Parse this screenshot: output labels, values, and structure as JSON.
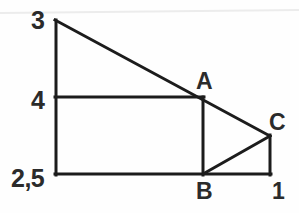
{
  "figure": {
    "type": "geometry-diagram",
    "width": 299,
    "height": 213,
    "background_color": "#fefefe",
    "stroke_color": "#1c1c1c",
    "stroke_width": 3,
    "labels": {
      "top_left": "3",
      "mid_left": "4",
      "bottom_left": "2,5",
      "point_a": "A",
      "point_b": "B",
      "point_c": "C",
      "bottom_right": "1"
    },
    "points": {
      "apex": [
        55,
        20
      ],
      "rect_top_left": [
        55,
        97
      ],
      "rect_bottom_left": [
        55,
        174
      ],
      "a": [
        203,
        97
      ],
      "b": [
        203,
        174
      ],
      "c": [
        270,
        136
      ],
      "rect_bottom_right": [
        270,
        174
      ]
    },
    "segments": [
      {
        "name": "left-vertical",
        "from": [
          55,
          20
        ],
        "to": [
          55,
          174
        ]
      },
      {
        "name": "hypotenuse",
        "from": [
          55,
          20
        ],
        "to": [
          270,
          136
        ]
      },
      {
        "name": "rect-top",
        "from": [
          55,
          97
        ],
        "to": [
          203,
          97
        ]
      },
      {
        "name": "rect-bottom",
        "from": [
          55,
          174
        ],
        "to": [
          270,
          174
        ]
      },
      {
        "name": "segment-ab",
        "from": [
          203,
          97
        ],
        "to": [
          203,
          174
        ]
      },
      {
        "name": "segment-bc",
        "from": [
          203,
          174
        ],
        "to": [
          270,
          136
        ]
      },
      {
        "name": "right-vertical",
        "from": [
          270,
          136
        ],
        "to": [
          270,
          174
        ]
      }
    ],
    "artifact_line": {
      "name": "scan-artifact",
      "from": [
        0,
        13
      ],
      "to": [
        299,
        10
      ],
      "color": "#e9e9e9"
    }
  }
}
